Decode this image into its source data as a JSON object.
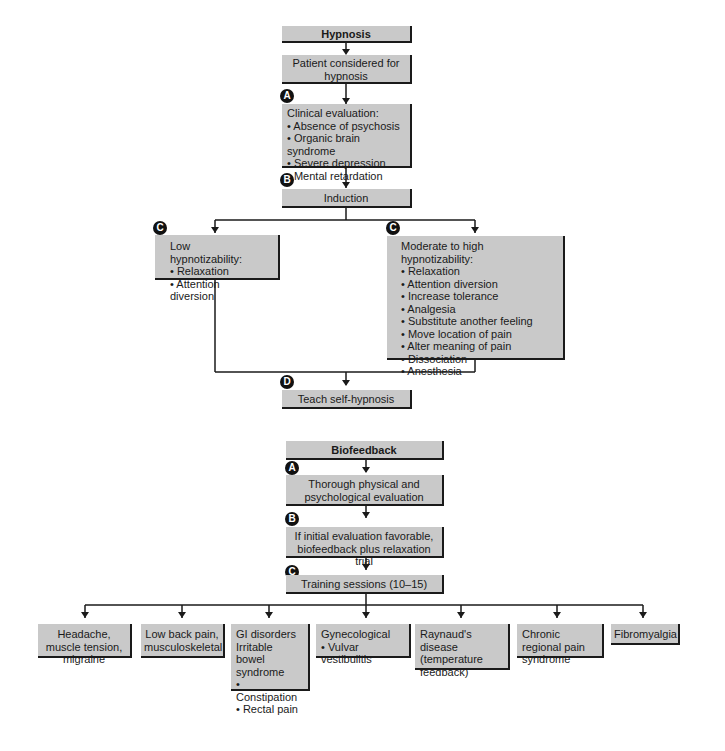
{
  "hypnosis": {
    "title": "Hypnosis",
    "patient": "Patient considered for hypnosis",
    "evaluation": {
      "badge": "A",
      "heading": "Clinical evaluation:",
      "items": [
        "Absence of psychosis",
        "Organic brain syndrome",
        "Severe depression",
        "Mental retardation"
      ]
    },
    "induction": {
      "badge": "B",
      "label": "Induction"
    },
    "low": {
      "badge": "C",
      "heading": "Low hypnotizability:",
      "items": [
        "Relaxation",
        "Attention diversion"
      ]
    },
    "high": {
      "badge": "C",
      "heading": "Moderate to high hypnotizability:",
      "items": [
        "Relaxation",
        "Attention diversion",
        "Increase tolerance",
        "Analgesia",
        "Substitute another feeling",
        "Move location of pain",
        "Alter meaning of pain",
        "Dissociation",
        "Anesthesia"
      ]
    },
    "self": {
      "badge": "D",
      "label": "Teach self-hypnosis"
    }
  },
  "biofeedback": {
    "title": "Biofeedback",
    "evaluation": {
      "badge": "A",
      "label": "Thorough physical and psychological evaluation"
    },
    "trial": {
      "badge": "B",
      "label": "If initial evaluation favorable, biofeedback plus relaxation trial"
    },
    "training": {
      "badge": "C",
      "label": "Training sessions (10–15)"
    },
    "conditions": [
      {
        "heading": "Headache, muscle tension, migraine",
        "items": []
      },
      {
        "heading": "Low back pain, musculoskeletal",
        "items": []
      },
      {
        "heading": "GI disorders Irritable bowel syndrome",
        "items": [
          "Constipation",
          "Rectal pain"
        ]
      },
      {
        "heading": "Gynecological",
        "items": [
          "Vulvar vestibulitis"
        ]
      },
      {
        "heading": "Raynaud's disease (temperature feedback)",
        "items": []
      },
      {
        "heading": "Chronic regional pain syndrome",
        "items": []
      },
      {
        "heading": "Fibromyalgia",
        "items": []
      }
    ]
  },
  "colors": {
    "box_fill": "#c9c9c9",
    "line": "#1a1a1a",
    "badge": "#111111"
  }
}
